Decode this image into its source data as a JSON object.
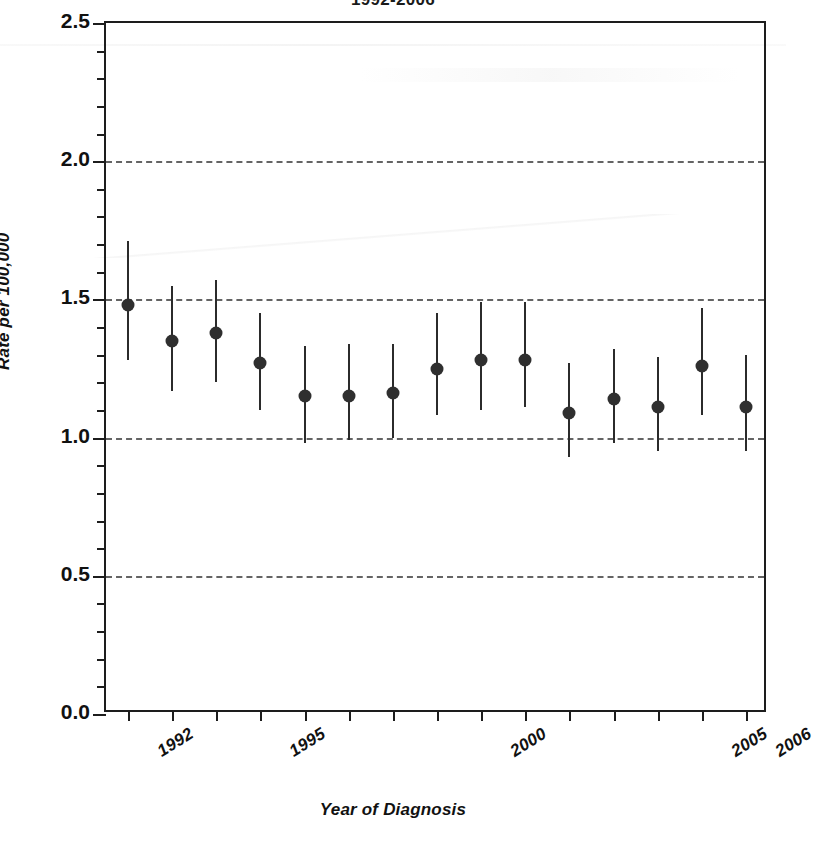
{
  "chart_title": "1992-2006",
  "axis": {
    "y_title": "Rate per 100,000",
    "x_title": "Year of Diagnosis",
    "y_ticks": [
      "0.0",
      "0.5",
      "1.0",
      "1.5",
      "2.0",
      "2.5"
    ],
    "x_tick_labels": [
      "1992",
      "1995",
      "2000",
      "2005",
      "2006"
    ]
  },
  "colors": {
    "marker": "#2f2f2f",
    "errorbar": "#2b2b2b",
    "grid": "#4a4a4a",
    "frame": "#1d1d1d",
    "background": "#ffffff"
  },
  "chart_data": {
    "type": "scatter",
    "title": "1992-2006",
    "xlabel": "Year of Diagnosis",
    "ylabel": "Rate per 100,000",
    "ylim": [
      0.0,
      2.5
    ],
    "xlim": [
      1991.5,
      2006.5
    ],
    "yticks": [
      0.0,
      0.5,
      1.0,
      1.5,
      2.0,
      2.5
    ],
    "grid": "horizontal dashed at 0.5, 1.0, 1.5, 2.0",
    "legend": "none",
    "error_bars": "vertical 95% confidence intervals",
    "x": [
      1992,
      1993,
      1994,
      1995,
      1996,
      1997,
      1998,
      1999,
      2000,
      2001,
      2002,
      2003,
      2004,
      2005,
      2006
    ],
    "categories": [
      "1992",
      "1993",
      "1994",
      "1995",
      "1996",
      "1997",
      "1998",
      "1999",
      "2000",
      "2001",
      "2002",
      "2003",
      "2004",
      "2005",
      "2006"
    ],
    "values": [
      1.48,
      1.35,
      1.38,
      1.27,
      1.15,
      1.15,
      1.16,
      1.25,
      1.28,
      1.28,
      1.09,
      1.14,
      1.11,
      1.26,
      1.11
    ],
    "ci_low": [
      1.28,
      1.17,
      1.2,
      1.1,
      0.98,
      0.99,
      1.0,
      1.08,
      1.1,
      1.11,
      0.93,
      0.98,
      0.95,
      1.08,
      0.95
    ],
    "ci_high": [
      1.71,
      1.55,
      1.57,
      1.45,
      1.33,
      1.34,
      1.34,
      1.45,
      1.49,
      1.49,
      1.27,
      1.32,
      1.29,
      1.47,
      1.3
    ]
  }
}
